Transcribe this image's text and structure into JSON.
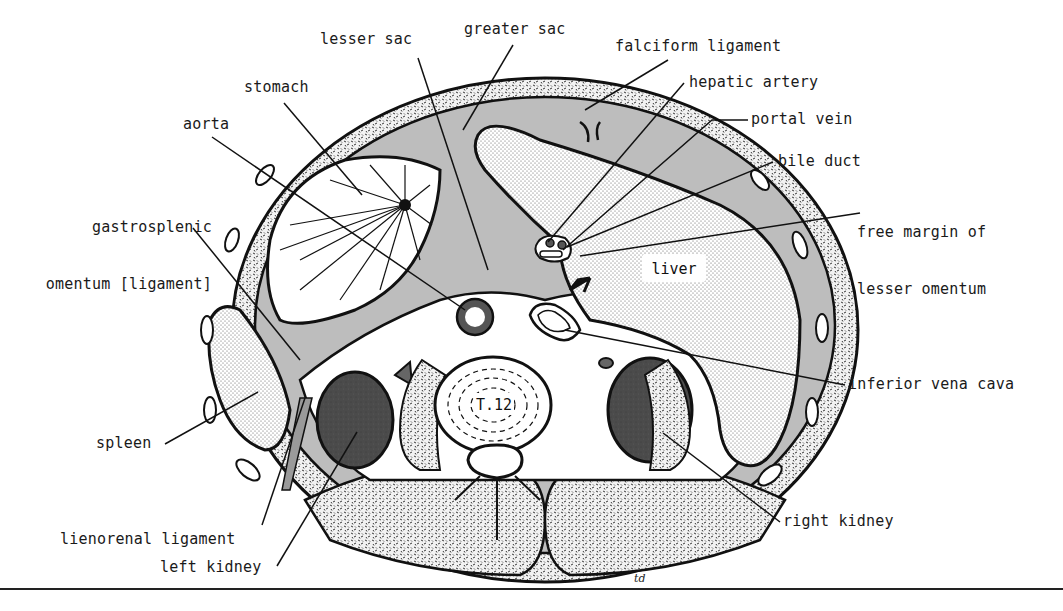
{
  "figure": {
    "type": "anatomical-cross-section",
    "vertebra_label": "T.12",
    "organ_inline_labels": {
      "liver": "liver"
    },
    "signature": "td",
    "colors": {
      "peritoneal_cavity": "#bdbdbd",
      "body_wall": "#d9d9d9",
      "kidney": "#4a4a4a",
      "outline": "#111111",
      "background": "#ffffff"
    }
  },
  "labels": {
    "lesser_sac": "lesser sac",
    "greater_sac": "greater sac",
    "falciform_ligament": "falciform ligament",
    "hepatic_artery": "hepatic artery",
    "stomach": "stomach",
    "portal_vein": "portal vein",
    "aorta": "aorta",
    "bile_duct": "bile duct",
    "gastrosplenic_line1": "gastrosplenic",
    "gastrosplenic_line2": "omentum [ligament]",
    "free_margin_line1": "free margin of",
    "free_margin_line2": "lesser omentum",
    "inferior_vena_cava": "inferior vena cava",
    "spleen": "spleen",
    "right_kidney": "right kidney",
    "lienorenal_ligament": "lienorenal ligament",
    "left_kidney": "left kidney"
  }
}
